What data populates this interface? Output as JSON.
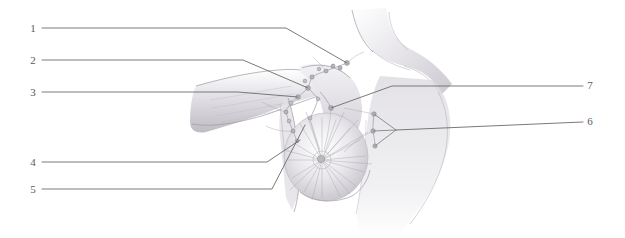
{
  "figure": {
    "style": "pencil-shaded anatomical line drawing",
    "background_color": "#ffffff",
    "line_color": "#6b6b6b",
    "node_color": "#b9b7bd",
    "shading_color": "#9d9aa1"
  },
  "labels": {
    "left": [
      {
        "id": "1",
        "text": "1",
        "x": 33,
        "y": 32
      },
      {
        "id": "2",
        "text": "2",
        "x": 33,
        "y": 64
      },
      {
        "id": "3",
        "text": "3",
        "x": 33,
        "y": 96
      },
      {
        "id": "4",
        "text": "4",
        "x": 33,
        "y": 166
      },
      {
        "id": "5",
        "text": "5",
        "x": 33,
        "y": 193
      }
    ],
    "right": [
      {
        "id": "7",
        "text": "7",
        "x": 590,
        "y": 89
      },
      {
        "id": "6",
        "text": "6",
        "x": 590,
        "y": 125
      }
    ]
  },
  "leader_lines": [
    {
      "for": "1",
      "path": "M 42 28 L 286 28 L 347 63",
      "side": "left"
    },
    {
      "for": "2",
      "path": "M 42 60 L 243 60 L 308 88",
      "side": "left"
    },
    {
      "for": "3",
      "path": "M 42 92 L 238 92 L 298 97",
      "side": "left"
    },
    {
      "for": "4",
      "path": "M 42 162 L 267 162 L 300 140",
      "side": "left"
    },
    {
      "for": "5",
      "path": "M 42 189 L 272 189 L 305 125",
      "side": "left"
    },
    {
      "for": "7",
      "path": "M 583 86 L 392 86 L 331 108",
      "side": "right"
    },
    {
      "for": "6",
      "path": "M 583 122 L 396 130",
      "side": "right"
    }
  ],
  "leader_branches": [
    {
      "for": "6",
      "path": "M 396 130 L 374 114"
    },
    {
      "for": "6",
      "path": "M 396 130 L 373 131"
    },
    {
      "for": "6",
      "path": "M 396 130 L 375 146"
    }
  ],
  "lymph_nodes": [
    {
      "group": "supraclavicular",
      "x": 347,
      "y": 63,
      "r": 2.4
    },
    {
      "group": "supraclavicular",
      "x": 340,
      "y": 68,
      "r": 2.0
    },
    {
      "group": "supraclavicular",
      "x": 333,
      "y": 66,
      "r": 1.9
    },
    {
      "group": "supraclavicular",
      "x": 326,
      "y": 71,
      "r": 2.0
    },
    {
      "group": "supraclavicular",
      "x": 319,
      "y": 69,
      "r": 1.8
    },
    {
      "group": "infraclavicular",
      "x": 312,
      "y": 77,
      "r": 2.1
    },
    {
      "group": "infraclavicular",
      "x": 305,
      "y": 81,
      "r": 1.9
    },
    {
      "group": "axillary-apical",
      "x": 308,
      "y": 88,
      "r": 2.4
    },
    {
      "group": "axillary-central",
      "x": 298,
      "y": 97,
      "r": 2.3
    },
    {
      "group": "axillary-central",
      "x": 291,
      "y": 103,
      "r": 2.1
    },
    {
      "group": "axillary-lateral",
      "x": 286,
      "y": 112,
      "r": 2.0
    },
    {
      "group": "axillary-lateral",
      "x": 289,
      "y": 121,
      "r": 1.9
    },
    {
      "group": "axillary-pectoral",
      "x": 293,
      "y": 131,
      "r": 2.0
    },
    {
      "group": "axillary-pectoral",
      "x": 297,
      "y": 141,
      "r": 1.9
    },
    {
      "group": "interpectoral",
      "x": 331,
      "y": 108,
      "r": 2.4
    },
    {
      "group": "parasternal",
      "x": 374,
      "y": 114,
      "r": 2.2
    },
    {
      "group": "parasternal",
      "x": 373,
      "y": 131,
      "r": 2.2
    },
    {
      "group": "parasternal",
      "x": 375,
      "y": 146,
      "r": 2.1
    },
    {
      "group": "breast-internal",
      "x": 318,
      "y": 99,
      "r": 1.8
    },
    {
      "group": "breast-internal",
      "x": 310,
      "y": 118,
      "r": 1.9
    }
  ],
  "anatomy_regions": [
    {
      "name": "neck",
      "description": "lower neck and sternocleidomastoid shading"
    },
    {
      "name": "clavicle",
      "description": "clavicular ridge above the axilla"
    },
    {
      "name": "upper-arm",
      "description": "abducted right arm extending to the left"
    },
    {
      "name": "axilla",
      "description": "axillary hollow containing the node chain"
    },
    {
      "name": "breast",
      "description": "left breast with radiating lymphatic ducts"
    },
    {
      "name": "nipple-areola",
      "description": "nipple and areola at the breast centre"
    },
    {
      "name": "sternum",
      "description": "sternal midline with parasternal node chain"
    },
    {
      "name": "torso",
      "description": "chest wall fading toward the lower edge"
    }
  ]
}
